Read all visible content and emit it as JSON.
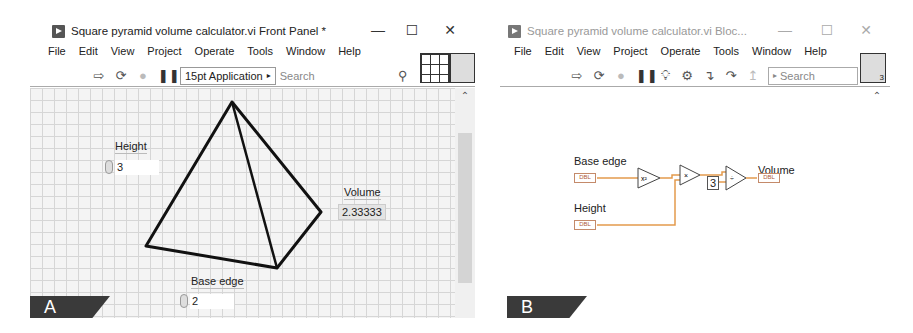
{
  "front_panel": {
    "title": "Square pyramid volume calculator.vi Front Panel *",
    "window_controls": {
      "minimize": "—",
      "maximize": "☐",
      "close": "✕"
    },
    "menu": [
      "File",
      "Edit",
      "View",
      "Project",
      "Operate",
      "Tools",
      "Window",
      "Help"
    ],
    "toolbar": {
      "icons": [
        "run-arrow-icon",
        "run-continuously-icon",
        "abort-icon",
        "pause-icon"
      ],
      "font_select": "15pt Application",
      "font_select_arrow": "▸",
      "search_placeholder": "Search"
    },
    "controls": {
      "height": {
        "label": "Height",
        "value": "3"
      },
      "base_edge": {
        "label": "Base edge",
        "value": "2"
      }
    },
    "indicators": {
      "volume": {
        "label": "Volume",
        "value": "2.33333"
      }
    },
    "panel_tag": "A"
  },
  "block_diagram": {
    "title": "Square pyramid volume calculator.vi Bloc...",
    "window_controls": {
      "minimize": "—",
      "maximize": "☐",
      "close": "✕"
    },
    "menu": [
      "File",
      "Edit",
      "View",
      "Project",
      "Operate",
      "Tools",
      "Window",
      "Help"
    ],
    "toolbar": {
      "icons": [
        "run-arrow-icon",
        "run-continuously-icon",
        "abort-icon",
        "pause-icon",
        "highlight-execution-icon",
        "retain-wire-values-icon",
        "step-into-icon",
        "step-over-icon",
        "step-out-icon"
      ],
      "search_placeholder": "Search",
      "search_arrow": "▸"
    },
    "nodes": {
      "base_edge_label": "Base edge",
      "height_label": "Height",
      "volume_label": "Volume",
      "terminal_type": "DBL",
      "square_fn": "x²",
      "multiply_fn": "×",
      "divide_fn": "÷",
      "constant": "3"
    },
    "connector_pane_number": "3",
    "panel_tag": "B"
  }
}
